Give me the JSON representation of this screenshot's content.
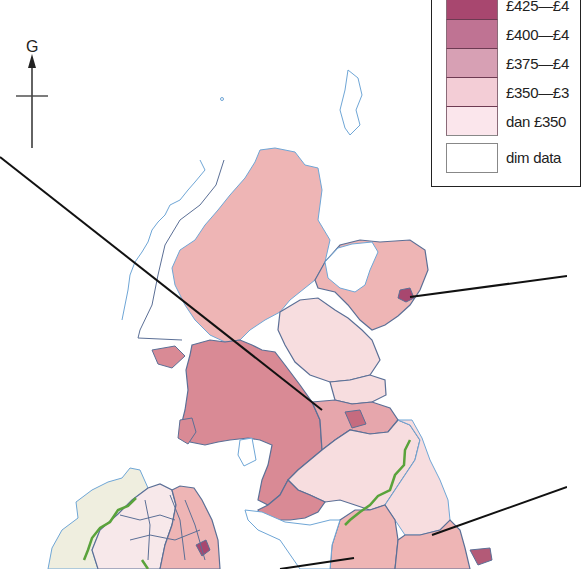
{
  "map": {
    "compass": {
      "label": "G",
      "icon": "north-arrow-icon"
    },
    "legend": {
      "items": [
        {
          "label": "£425—£4",
          "color": "#a8476f"
        },
        {
          "label": "£400—£4",
          "color": "#bf7393"
        },
        {
          "label": "£375—£4",
          "color": "#d7a0b4"
        },
        {
          "label": "£350—£3",
          "color": "#f3cdd6"
        },
        {
          "label": "dan £350",
          "color": "#fbe6ec"
        },
        {
          "label": "dim data",
          "color": "#ffffff"
        }
      ]
    },
    "region_fills": {
      "highlands": "#eeb5b5",
      "grampian": "#eeb5b5",
      "aberdeen": "#a8476f",
      "tayside": "#f7dddf",
      "fife": "#f7dddf",
      "strathclyde": "#d98a95",
      "lothian": "#e6a6ac",
      "edinburgh": "#c56b7f",
      "borders": "#f7dddf",
      "dumfries": "#d98a95",
      "northumbria": "#f7dddf",
      "cumbria": "#eeb5b5",
      "durham": "#eeb5b5",
      "teesside": "#b35a77",
      "ni_east": "#eeb5b5",
      "ni_belfast": "#a8476f",
      "ni_west": "#f7e8ea",
      "ireland": "#efeedf",
      "nodata": "#ffffff"
    },
    "border_color": "#5b6f96",
    "coast_color": "#6fa6d6",
    "national_border_color": "#5aa33b",
    "leader_line_color": "#111111"
  }
}
